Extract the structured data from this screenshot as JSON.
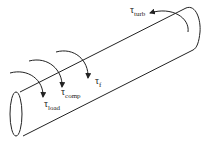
{
  "diagram": {
    "type": "shaft-torque-diagram",
    "shape": "cylinder",
    "stroke_color": "#222222",
    "background": "#ffffff",
    "torques": [
      {
        "id": "load",
        "symbol": "τ",
        "subscript": "load"
      },
      {
        "id": "comp",
        "symbol": "τ",
        "subscript": "comp"
      },
      {
        "id": "f",
        "symbol": "τ",
        "subscript": "f"
      },
      {
        "id": "turb",
        "symbol": "τ",
        "subscript": "turb"
      }
    ]
  }
}
